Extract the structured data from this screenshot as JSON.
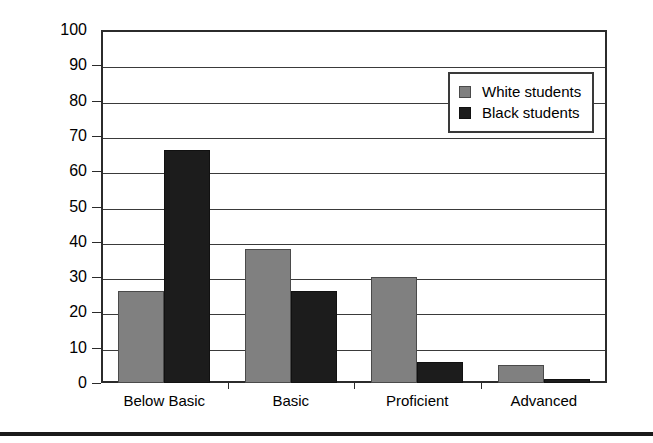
{
  "chart_data": {
    "type": "bar",
    "title": "",
    "subtitle": "",
    "xlabel": "",
    "ylabel": "",
    "ylim": [
      0,
      100
    ],
    "ytick_step": 10,
    "yticks": [
      0,
      10,
      20,
      30,
      40,
      50,
      60,
      70,
      80,
      90,
      100
    ],
    "ytick_labels": [
      "0",
      "10",
      "20",
      "30",
      "40",
      "50",
      "60",
      "70",
      "80",
      "90",
      "100"
    ],
    "grid": true,
    "grid_axis": "y",
    "legend_position": "upper right",
    "categories": [
      "Below Basic",
      "Basic",
      "Proficient",
      "Advanced"
    ],
    "series": [
      {
        "name": "White students",
        "color": "#808080",
        "values": [
          26,
          38,
          30,
          5
        ]
      },
      {
        "name": "Black students",
        "color": "#1c1c1c",
        "values": [
          66,
          26,
          6,
          1
        ]
      }
    ],
    "annotations": []
  },
  "legend": {
    "entries": [
      {
        "label": "White students",
        "swatch": "white-series-swatch"
      },
      {
        "label": "Black students",
        "swatch": "black-series-swatch"
      }
    ]
  }
}
